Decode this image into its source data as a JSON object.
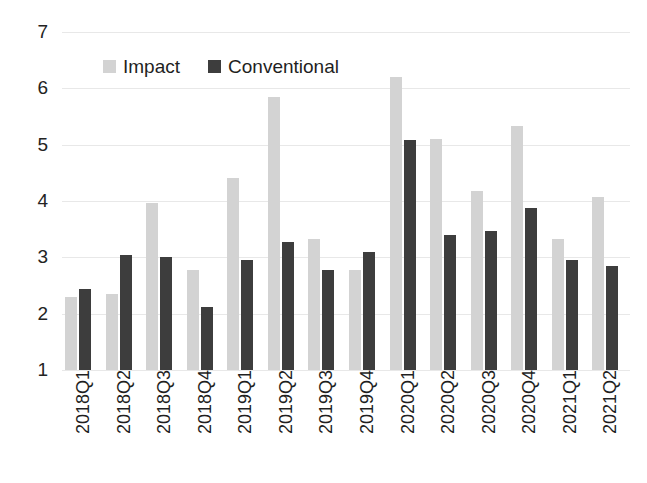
{
  "chart_data": {
    "type": "bar",
    "title": "",
    "xlabel": "",
    "ylabel": "",
    "ylim": [
      1,
      7
    ],
    "yticks": [
      1,
      2,
      3,
      4,
      5,
      6,
      7
    ],
    "grid": true,
    "legend_position": "top-left-inside",
    "categories": [
      "2018Q1",
      "2018Q2",
      "2018Q3",
      "2018Q4",
      "2019Q1",
      "2019Q2",
      "2019Q3",
      "2019Q4",
      "2020Q1",
      "2020Q2",
      "2020Q3",
      "2020Q4",
      "2021Q1",
      "2021Q2"
    ],
    "series": [
      {
        "name": "Impact",
        "color": "#d3d3d3",
        "values": [
          2.3,
          2.35,
          3.97,
          2.77,
          4.4,
          5.85,
          3.33,
          2.77,
          6.2,
          5.1,
          4.18,
          5.33,
          3.33,
          4.08
        ]
      },
      {
        "name": "Conventional",
        "color": "#3d3d3d",
        "values": [
          2.43,
          3.05,
          3.0,
          2.12,
          2.95,
          3.28,
          2.78,
          3.1,
          5.08,
          3.4,
          3.47,
          3.87,
          2.95,
          2.85
        ]
      }
    ]
  },
  "legend": {
    "items": [
      {
        "label": "Impact",
        "swatch": "impact-swatch"
      },
      {
        "label": "Conventional",
        "swatch": "conventional-swatch"
      }
    ]
  }
}
